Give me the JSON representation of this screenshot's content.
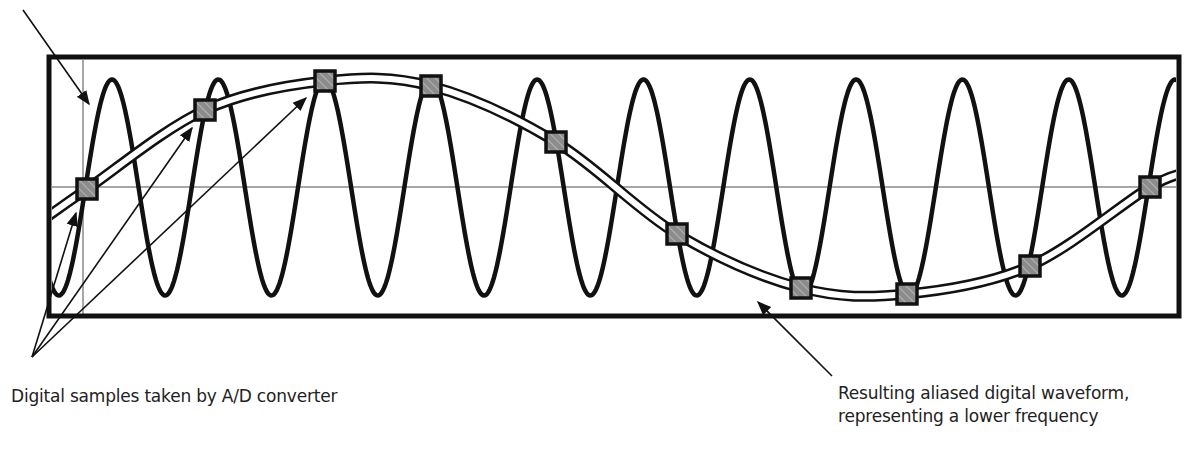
{
  "labels": {
    "samples": "Digital samples taken by A/D converter",
    "aliased_line1": "Resulting aliased digital waveform,",
    "aliased_line2": "representing a lower frequency"
  },
  "colors": {
    "stroke": "#111111",
    "axis": "#8a8a8a",
    "sample_fill": "#8c8c8c",
    "background": "#ffffff"
  },
  "chart_data": {
    "type": "line",
    "title": "",
    "xlabel": "",
    "ylabel": "",
    "grid": false,
    "series": [
      {
        "name": "Original high-frequency analog signal",
        "period_px": 106.3,
        "cycles_visible": 10.6,
        "amplitude": 1.0
      },
      {
        "name": "Resulting aliased digital waveform",
        "period_px": 1200,
        "amplitude": 0.95
      }
    ],
    "samples": [
      {
        "x": 87,
        "y": 189
      },
      {
        "x": 205,
        "y": 110
      },
      {
        "x": 325,
        "y": 81
      },
      {
        "x": 431,
        "y": 86
      },
      {
        "x": 556,
        "y": 142
      },
      {
        "x": 677,
        "y": 234
      },
      {
        "x": 801,
        "y": 288
      },
      {
        "x": 907,
        "y": 294
      },
      {
        "x": 1030,
        "y": 266
      },
      {
        "x": 1150,
        "y": 187
      }
    ],
    "annotations": [
      "Digital samples taken by A/D converter",
      "Resulting aliased digital waveform, representing a lower frequency"
    ]
  }
}
